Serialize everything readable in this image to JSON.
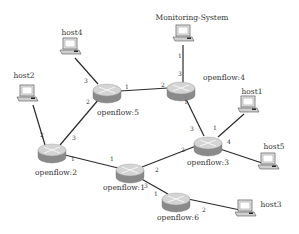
{
  "colors": {
    "link": "#2a2a2a",
    "router_top": "#d4d4d4",
    "router_side": "#8a8a8a",
    "host_body": "#e6e6e6",
    "host_screen": "#ffffff",
    "text": "#333333"
  },
  "routers": [
    {
      "id": "openflow5",
      "label": "openflow:5",
      "x": 107,
      "y": 90,
      "lx": 118,
      "ly": 115
    },
    {
      "id": "openflow4",
      "label": "openflow:4",
      "x": 181,
      "y": 88,
      "lx": 224,
      "ly": 80
    },
    {
      "id": "openflow2",
      "label": "openflow:2",
      "x": 52,
      "y": 150,
      "lx": 56,
      "ly": 175
    },
    {
      "id": "openflow1",
      "label": "openflow:1",
      "x": 130,
      "y": 170,
      "lx": 124,
      "ly": 190
    },
    {
      "id": "openflow3",
      "label": "openflow:3",
      "x": 208,
      "y": 143,
      "lx": 208,
      "ly": 165
    },
    {
      "id": "openflow6",
      "label": "openflow:6",
      "x": 176,
      "y": 199,
      "lx": 178,
      "ly": 220
    }
  ],
  "hosts": [
    {
      "id": "host4",
      "label": "host4",
      "x": 70,
      "y": 48,
      "lx": 72,
      "ly": 35
    },
    {
      "id": "host2",
      "label": "host2",
      "x": 27,
      "y": 95,
      "lx": 24,
      "ly": 78
    },
    {
      "id": "monitoring",
      "label": "Monitoring-System",
      "x": 183,
      "y": 35,
      "lx": 192,
      "ly": 20
    },
    {
      "id": "host1",
      "label": "host1",
      "x": 248,
      "y": 106,
      "lx": 252,
      "ly": 94
    },
    {
      "id": "host5",
      "label": "host5",
      "x": 268,
      "y": 163,
      "lx": 274,
      "ly": 149
    },
    {
      "id": "host3",
      "label": "host3",
      "x": 245,
      "y": 210,
      "lx": 271,
      "ly": 207
    }
  ],
  "links": [
    {
      "from": [
        75,
        58
      ],
      "to": [
        98,
        84
      ]
    },
    {
      "from": [
        33,
        105
      ],
      "to": [
        45,
        145
      ]
    },
    {
      "from": [
        183,
        45
      ],
      "to": [
        183,
        83
      ]
    },
    {
      "from": [
        120,
        91
      ],
      "to": [
        168,
        88
      ]
    },
    {
      "from": [
        99,
        99
      ],
      "to": [
        60,
        145
      ]
    },
    {
      "from": [
        65,
        155
      ],
      "to": [
        118,
        168
      ]
    },
    {
      "from": [
        142,
        167
      ],
      "to": [
        196,
        146
      ]
    },
    {
      "from": [
        185,
        97
      ],
      "to": [
        204,
        136
      ]
    },
    {
      "from": [
        244,
        114
      ],
      "to": [
        218,
        137
      ]
    },
    {
      "from": [
        220,
        149
      ],
      "to": [
        262,
        163
      ]
    },
    {
      "from": [
        138,
        177
      ],
      "to": [
        168,
        194
      ]
    },
    {
      "from": [
        188,
        199
      ],
      "to": [
        240,
        210
      ]
    }
  ],
  "ports": [
    {
      "text": "3",
      "x": 86,
      "y": 83
    },
    {
      "text": "2",
      "x": 88,
      "y": 104
    },
    {
      "text": "1",
      "x": 127,
      "y": 89
    },
    {
      "text": "2",
      "x": 163,
      "y": 87
    },
    {
      "text": "3",
      "x": 180,
      "y": 76
    },
    {
      "text": "1",
      "x": 180,
      "y": 58
    },
    {
      "text": "1",
      "x": 186,
      "y": 104
    },
    {
      "text": "2",
      "x": 42,
      "y": 137
    },
    {
      "text": "3",
      "x": 74,
      "y": 140
    },
    {
      "text": "1",
      "x": 73,
      "y": 161
    },
    {
      "text": "1",
      "x": 112,
      "y": 161
    },
    {
      "text": "2",
      "x": 157,
      "y": 172
    },
    {
      "text": "3",
      "x": 146,
      "y": 188
    },
    {
      "text": "3",
      "x": 192,
      "y": 131
    },
    {
      "text": "1",
      "x": 215,
      "y": 130
    },
    {
      "text": "4",
      "x": 229,
      "y": 144
    },
    {
      "text": "2",
      "x": 183,
      "y": 152
    },
    {
      "text": "1",
      "x": 156,
      "y": 196
    },
    {
      "text": "2",
      "x": 204,
      "y": 212
    }
  ]
}
